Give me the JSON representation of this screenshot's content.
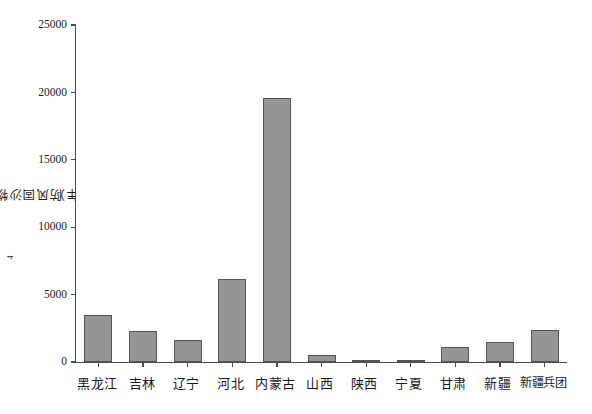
{
  "chart_data": {
    "type": "bar",
    "title": "",
    "xlabel": "",
    "ylabel": "防风固沙物质量（×10⁴ 吨/年）",
    "ylabel_prefix": "防风固沙物质量（×10",
    "ylabel_exponent": "4",
    "ylabel_suffix": " 吨/年）",
    "categories": [
      "黑龙江",
      "吉林",
      "辽宁",
      "河北",
      "内蒙古",
      "山西",
      "陕西",
      "宁夏",
      "甘肃",
      "新疆",
      "新疆兵团"
    ],
    "values": [
      3490,
      2300,
      1630,
      6160,
      19580,
      520,
      30,
      150,
      1110,
      1480,
      2370
    ],
    "ylim": [
      0,
      25000
    ],
    "yticks": [
      0,
      5000,
      10000,
      15000,
      20000,
      25000
    ],
    "ytick_labels": [
      "0",
      "5000",
      "10000",
      "15000",
      "20000",
      "25000"
    ],
    "grid": false,
    "legend": null,
    "bar_color": "#959595",
    "bar_edge_color": "#555555",
    "axis_color": "#4a4a4a",
    "background_color": "#ffffff"
  },
  "axis": {
    "y_title_label": "y-axis-title"
  }
}
